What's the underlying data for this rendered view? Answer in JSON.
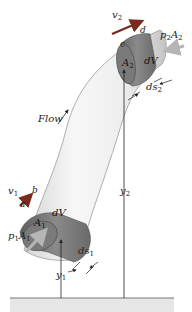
{
  "diagram": {
    "flow_label": "Flow",
    "section_1": {
      "velocity": {
        "main": "v",
        "sub": "1"
      },
      "area": {
        "main": "A",
        "sub": "1"
      },
      "volume": "dV",
      "force": {
        "main": "p",
        "sub": "1",
        "main2": "A",
        "sub2": "1"
      },
      "displacement": {
        "main": "ds",
        "sub": "1"
      },
      "height": {
        "main": "y",
        "sub": "1"
      },
      "point_a": "a",
      "point_b": "b"
    },
    "section_2": {
      "velocity": {
        "main": "v",
        "sub": "2"
      },
      "area": {
        "main": "A",
        "sub": "2"
      },
      "volume": "dV",
      "force": {
        "main": "p",
        "sub": "2",
        "main2": "A",
        "sub2": "2"
      },
      "displacement": {
        "main": "ds",
        "sub": "2"
      },
      "height": {
        "main": "y",
        "sub": "2"
      },
      "point_c": "c",
      "point_d": "d"
    },
    "colors": {
      "tube_light": "#f2f2f2",
      "tube_shade": "#c8c8c8",
      "volume_dark": "#6e6e6e",
      "volume_mid": "#8c8c8c",
      "arrow_red": "#7a2a1e",
      "force_arrow": "#bdbdbd",
      "ground": "#e6e6e6",
      "line": "#333333"
    }
  }
}
